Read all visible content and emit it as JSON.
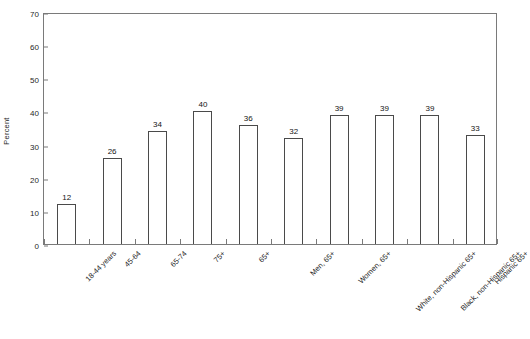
{
  "chart_data": {
    "type": "bar",
    "title": "",
    "subtitle": "",
    "xlabel": "",
    "ylabel": "Percent",
    "ylim": [
      0,
      70
    ],
    "ytick_step": 10,
    "yticks": [
      0,
      10,
      20,
      30,
      40,
      50,
      60,
      70
    ],
    "grid": false,
    "legend": null,
    "bar_style": {
      "fill": "#ffffff",
      "outline": "#4a4a4a",
      "show_value_labels": true
    },
    "categories": [
      "18-44 years",
      "45-64",
      "65-74",
      "75+",
      "65+",
      "Men, 65+",
      "Women, 65+",
      "White, non-Hispanic 65+",
      "Black, non-Hispanic 65+",
      "Hispanic 65+"
    ],
    "values": [
      12,
      26,
      34,
      40,
      36,
      32,
      39,
      39,
      39,
      33
    ],
    "value_labels": [
      "12",
      "26",
      "34",
      "40",
      "36",
      "32",
      "39",
      "39",
      "39",
      "33"
    ]
  },
  "axes": {
    "y_tick_labels": [
      "0",
      "10",
      "20",
      "30",
      "40",
      "50",
      "60",
      "70"
    ],
    "y_axis_title": "Percent"
  }
}
